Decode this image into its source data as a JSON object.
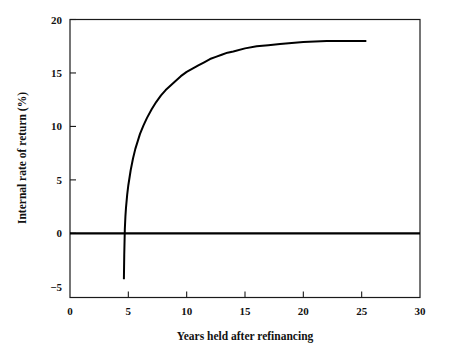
{
  "chart_data": {
    "type": "line",
    "title": "",
    "subtitle": "",
    "xlabel": "Years held after refinancing",
    "ylabel": "Internal rate of return (%)",
    "xlim": [
      0,
      30
    ],
    "ylim": [
      -6,
      20
    ],
    "grid": false,
    "legend": null,
    "x_ticks": [
      0,
      5,
      10,
      15,
      20,
      25,
      30
    ],
    "x_tick_labels": [
      "0",
      "5",
      "10",
      "15",
      "20",
      "25",
      "30"
    ],
    "y_ticks": [
      -5,
      0,
      5,
      10,
      15,
      20
    ],
    "y_tick_labels": [
      "−5",
      "0",
      "5",
      "10",
      "15",
      "20"
    ],
    "annotations": [],
    "series": [
      {
        "name": "Internal rate of return",
        "color": "#000000",
        "x": [
          4.62,
          4.65,
          4.7,
          4.75,
          4.8,
          4.9,
          5.0,
          5.2,
          5.4,
          5.6,
          5.8,
          6.0,
          6.3,
          6.6,
          7.0,
          7.4,
          7.8,
          8.2,
          8.6,
          9.0,
          9.5,
          10.0,
          10.5,
          11.0,
          11.5,
          12.0,
          12.5,
          13.0,
          13.5,
          14.0,
          15.0,
          16.0,
          17.0,
          18.0,
          19.0,
          20.0,
          21.0,
          22.0,
          23.0,
          24.0,
          25.4
        ],
        "y": [
          -4.3,
          -2.0,
          0.4,
          1.6,
          2.4,
          3.6,
          4.5,
          5.9,
          7.0,
          7.9,
          8.6,
          9.3,
          10.1,
          10.8,
          11.6,
          12.3,
          12.9,
          13.4,
          13.8,
          14.2,
          14.7,
          15.1,
          15.4,
          15.7,
          16.0,
          16.3,
          16.5,
          16.7,
          16.9,
          17.0,
          17.3,
          17.5,
          17.6,
          17.7,
          17.8,
          17.9,
          17.95,
          18.0,
          18.0,
          18.0,
          18.0
        ]
      }
    ],
    "reference_lines": [
      {
        "name": "zero-line",
        "orientation": "horizontal",
        "value": 0,
        "color": "#000000"
      }
    ]
  },
  "axes": {
    "y_title": "Internal rate of return (%)",
    "x_title": "Years held after refinancing",
    "x_labels": [
      "0",
      "5",
      "10",
      "15",
      "20",
      "25",
      "30"
    ],
    "y_labels": [
      "20",
      "15",
      "10",
      "5",
      "0",
      "−5"
    ]
  }
}
